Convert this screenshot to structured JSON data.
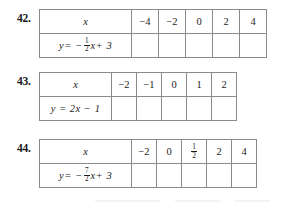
{
  "page": {
    "exercises": [
      {
        "number": "42.",
        "label_column_width": 92,
        "value_column_width": 27,
        "row_x": {
          "label": "x",
          "values": [
            "−4",
            "−2",
            "0",
            "2",
            "4"
          ]
        },
        "row_y": {
          "label_parts": {
            "lhs": "y",
            "equals": "=",
            "minus": "−",
            "fraction": {
              "numerator": "1",
              "denominator": "2"
            },
            "variable": "x",
            "plus": "+",
            "constant": "3"
          },
          "label_text": "y = − 1/2 x + 3",
          "values": [
            "",
            "",
            "",
            "",
            ""
          ]
        }
      },
      {
        "number": "43.",
        "label_column_width": 72,
        "value_column_width": 25,
        "row_x": {
          "label": "x",
          "values": [
            "−2",
            "−1",
            "0",
            "1",
            "2"
          ]
        },
        "row_y": {
          "label_parts": {
            "lhs": "y",
            "equals": "=",
            "minus": "",
            "fraction": null,
            "variable": "2x",
            "plus": "−",
            "constant": "1"
          },
          "label_text": "y = 2x − 1",
          "values": [
            "",
            "",
            "",
            "",
            ""
          ]
        }
      },
      {
        "number": "44.",
        "label_column_width": 92,
        "value_column_width": 25,
        "row_x": {
          "label": "x",
          "values": [
            "−2",
            "0",
            "1/2",
            "2",
            "4"
          ],
          "value_fractions": [
            null,
            null,
            {
              "numerator": "1",
              "denominator": "2"
            },
            null,
            null
          ]
        },
        "row_y": {
          "label_parts": {
            "lhs": "y",
            "equals": "=",
            "minus": "−",
            "fraction": {
              "numerator": "7",
              "denominator": "2"
            },
            "variable": "x",
            "plus": "+",
            "constant": "3"
          },
          "label_text": "y = − 7/2 x + 3",
          "values": [
            "",
            "",
            "",
            "",
            ""
          ]
        }
      }
    ],
    "colors": {
      "label_cell_background": "#c9c9c9",
      "cell_background": "#ffffff",
      "border": "#8a8a8a",
      "text": "#1c1c1c",
      "page_background": "#ffffff"
    }
  }
}
